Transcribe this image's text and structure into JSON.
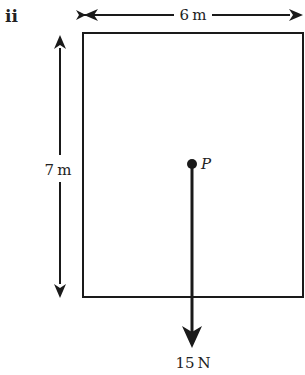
{
  "part_label": "ii",
  "width_label": "6 m",
  "height_label": "7 m",
  "point_label": "P",
  "force_label": "15 N",
  "colors": {
    "stroke": "#1a1a1a",
    "background": "#ffffff"
  }
}
